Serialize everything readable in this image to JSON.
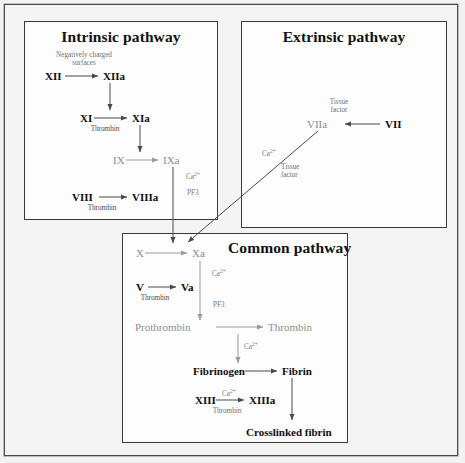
{
  "figure": {
    "background": "#f2f2f2",
    "panel_background": "#fdfdfd",
    "border_color": "#3a3a3a",
    "black_text": "#0d0d0d",
    "gray_text": "#8d8d8d",
    "caption_color": "#6f6f6f"
  },
  "panels": {
    "intrinsic": {
      "title": "Intrinsic pathway"
    },
    "extrinsic": {
      "title": "Extrinsic pathway"
    },
    "common": {
      "title": "Common pathway"
    }
  },
  "labels": {
    "negatively_charged_surfaces": "Negatively charged\nsurfaces",
    "negatively_charged_line1": "Negatively charged",
    "negatively_charged_line2": "surfaces",
    "tissue_factor_line1": "Tissue",
    "tissue_factor_line2": "factor",
    "tissue_factor_lower_line1": "Tissue",
    "tissue_factor_lower_line2": "factor",
    "thrombin": "Thrombin",
    "calcium": "Ca2+",
    "calcium_display": "Ca",
    "calcium_sup": "2+",
    "pf3": "PF3"
  },
  "nodes": {
    "intrinsic": [
      {
        "id": "XII",
        "text": "XII",
        "style": "black"
      },
      {
        "id": "XIIa",
        "text": "XIIa",
        "style": "black"
      },
      {
        "id": "XI",
        "text": "XI",
        "style": "black"
      },
      {
        "id": "XIa",
        "text": "XIa",
        "style": "black"
      },
      {
        "id": "IX",
        "text": "IX",
        "style": "gray"
      },
      {
        "id": "IXa",
        "text": "IXa",
        "style": "gray"
      },
      {
        "id": "VIII",
        "text": "VIII",
        "style": "black"
      },
      {
        "id": "VIIIa",
        "text": "VIIIa",
        "style": "black"
      }
    ],
    "extrinsic": [
      {
        "id": "VIIa",
        "text": "VIIa",
        "style": "gray"
      },
      {
        "id": "VII",
        "text": "VII",
        "style": "black"
      }
    ],
    "common": [
      {
        "id": "X",
        "text": "X",
        "style": "gray"
      },
      {
        "id": "Xa",
        "text": "Xa",
        "style": "gray"
      },
      {
        "id": "V",
        "text": "V",
        "style": "black"
      },
      {
        "id": "Va",
        "text": "Va",
        "style": "black"
      },
      {
        "id": "Prothrombin",
        "text": "Prothrombin",
        "style": "gray"
      },
      {
        "id": "Thrombin",
        "text": "Thrombin",
        "style": "gray"
      },
      {
        "id": "Fibrinogen",
        "text": "Fibrinogen",
        "style": "black"
      },
      {
        "id": "Fibrin",
        "text": "Fibrin",
        "style": "black"
      },
      {
        "id": "XIII",
        "text": "XIII",
        "style": "black"
      },
      {
        "id": "XIIIa",
        "text": "XIIIa",
        "style": "black"
      },
      {
        "id": "CrosslinkedFibrin",
        "text": "Crosslinked fibrin",
        "style": "black"
      }
    ]
  },
  "edges": [
    {
      "from": "XII",
      "to": "XIIa",
      "caption": "Negatively charged surfaces"
    },
    {
      "from": "XIIa",
      "to": "XI",
      "caption": ""
    },
    {
      "from": "XI",
      "to": "XIa",
      "caption": "Thrombin"
    },
    {
      "from": "XIa",
      "to": "IX",
      "caption": ""
    },
    {
      "from": "IX",
      "to": "IXa",
      "caption": ""
    },
    {
      "from": "VIII",
      "to": "VIIIa",
      "caption": "Thrombin"
    },
    {
      "from": "IXa",
      "to": "Xa",
      "caption": "Ca2+, PF3"
    },
    {
      "from": "VII",
      "to": "VIIa",
      "caption": "Tissue factor"
    },
    {
      "from": "VIIa",
      "to": "Xa",
      "caption": "Ca2+, Tissue factor"
    },
    {
      "from": "X",
      "to": "Xa",
      "caption": ""
    },
    {
      "from": "V",
      "to": "Va",
      "caption": "Thrombin"
    },
    {
      "from": "Xa",
      "to": "Prothrombin",
      "caption": "Ca2+, PF3"
    },
    {
      "from": "Prothrombin",
      "to": "Thrombin",
      "caption": ""
    },
    {
      "from": "Thrombin",
      "to": "Fibrinogen",
      "caption": "Ca2+"
    },
    {
      "from": "Fibrinogen",
      "to": "Fibrin",
      "caption": ""
    },
    {
      "from": "XIII",
      "to": "XIIIa",
      "caption": "Ca2+, Thrombin"
    },
    {
      "from": "Fibrin",
      "to": "CrosslinkedFibrin",
      "caption": ""
    }
  ]
}
